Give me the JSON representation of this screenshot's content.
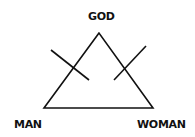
{
  "diagram": {
    "type": "triangle",
    "labels": {
      "top": "GOD",
      "bottom_left": "MAN",
      "bottom_right": "WOMAN"
    },
    "annotations": [
      "crossed-out left edge",
      "crossed-out right edge"
    ],
    "colors": {
      "stroke": "#111111",
      "background": "#ffffff"
    }
  }
}
